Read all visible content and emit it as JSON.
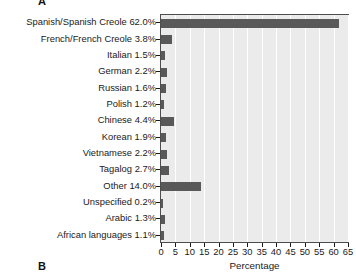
{
  "figure": {
    "panel_label_a": "A",
    "panel_label_b": "B"
  },
  "chart_data": {
    "type": "bar",
    "orientation": "horizontal",
    "title": "",
    "xlabel": "Percentage",
    "ylabel": "",
    "xlim": [
      0,
      65
    ],
    "xticks": [
      0,
      5,
      10,
      15,
      20,
      25,
      30,
      35,
      40,
      45,
      50,
      55,
      60,
      65
    ],
    "xtick_labels": [
      "0",
      "5",
      "10",
      "15",
      "20",
      "25",
      "30",
      "35",
      "40",
      "45",
      "50",
      "55",
      "60",
      "65"
    ],
    "grid": "vertical-white-gridlines",
    "legend": "none",
    "bar_color": "#595959",
    "panel_color": "#ebebeb",
    "categories": [
      "Spanish/Spanish Creole",
      "French/French Creole",
      "Italian",
      "German",
      "Russian",
      "Polish",
      "Chinese",
      "Korean",
      "Vietnamese",
      "Tagalog",
      "Other",
      "Unspecified",
      "Arabic",
      "African languages"
    ],
    "values": [
      62.0,
      3.8,
      1.5,
      2.2,
      1.6,
      1.2,
      4.4,
      1.9,
      2.2,
      2.7,
      14.0,
      0.2,
      1.3,
      1.1
    ],
    "tick_labels": [
      "Spanish/Spanish Creole 62.0%",
      "French/French Creole 3.8%",
      "Italian 1.5%",
      "German 2.2%",
      "Russian 1.6%",
      "Polish 1.2%",
      "Chinese 4.4%",
      "Korean 1.9%",
      "Vietnamese 2.2%",
      "Tagalog 2.7%",
      "Other 14.0%",
      "Unspecified 0.2%",
      "Arabic 1.3%",
      "African languages 1.1%"
    ]
  }
}
